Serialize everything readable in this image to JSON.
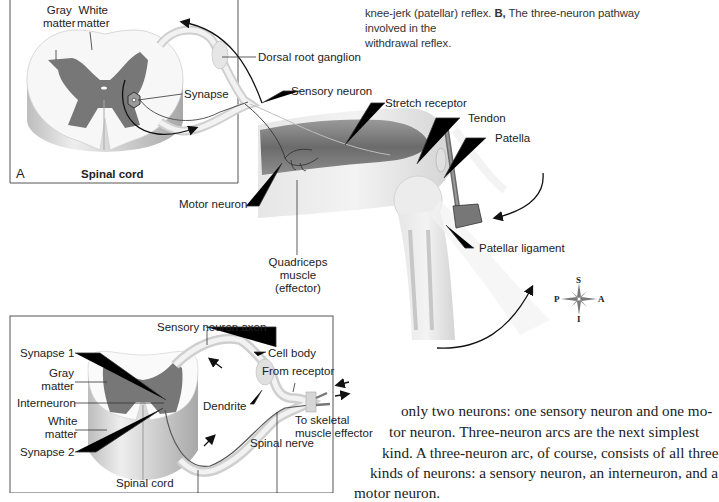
{
  "caption": {
    "line1_partial": "knee-jerk (patellar) reflex.",
    "label_b": "B,",
    "line1_rest": "The three-neuron pathway involved in the",
    "line2": "withdrawal reflex."
  },
  "panel_a": {
    "letter": "A",
    "title": "Spinal cord",
    "labels": {
      "gray_matter": "Gray\nmatter",
      "gray": "Gray",
      "gray_matter_word": "matter",
      "white": "White",
      "white_matter_word": "matter",
      "synapse": "Synapse",
      "dorsal_root_ganglion": "Dorsal root ganglion",
      "sensory_neuron": "Sensory neuron",
      "stretch_receptor": "Stretch receptor",
      "tendon": "Tendon",
      "patella": "Patella",
      "motor_neuron": "Motor neuron",
      "patellar_ligament": "Patellar ligament",
      "quadriceps_1": "Quadriceps",
      "quadriceps_2": "muscle",
      "quadriceps_3": "(effector)"
    }
  },
  "compass": {
    "s": "S",
    "i": "I",
    "p": "P",
    "a": "A"
  },
  "panel_b": {
    "labels": {
      "sensory_neuron_axon": "Sensory neuron axon",
      "synapse_1": "Synapse 1",
      "gray": "Gray",
      "gray_matter_word": "matter",
      "interneuron": "Interneuron",
      "white": "White",
      "white_matter_word": "matter",
      "synapse_2": "Synapse 2",
      "spinal_cord": "Spinal cord",
      "cell_body": "Cell body",
      "from_receptor": "From receptor",
      "dendrite": "Dendrite",
      "to_skeletal_1": "To skeletal",
      "to_skeletal_2": "muscle effector",
      "spinal_nerve": "Spinal nerve"
    }
  },
  "body_text": {
    "line1": "only two neurons: one sensory neuron and one mo-",
    "line2": "tor neuron. Three-neuron arcs are the next simplest",
    "line3": "kind. A three-neuron arc, of course, consists of all three",
    "line4": "kinds of neurons: a sensory neuron, an interneuron, and a",
    "line5": "motor neuron."
  }
}
